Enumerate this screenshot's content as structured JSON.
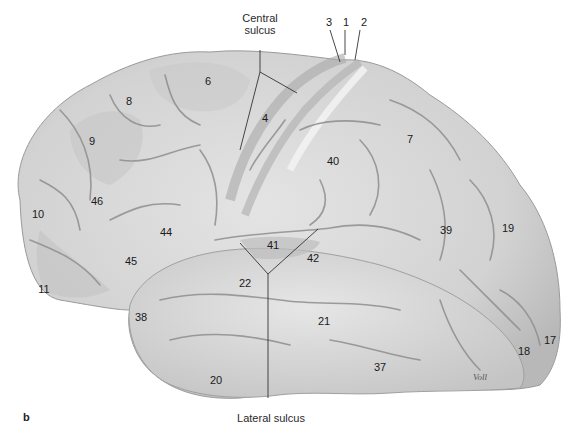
{
  "figure": {
    "panel_label": "b",
    "signature": "Voll",
    "leaders": {
      "central_sulcus": "Central\nsulcus",
      "central_sulcus_line1": "Central",
      "central_sulcus_line2": "sulcus",
      "lateral_sulcus": "Lateral sulcus",
      "top_numbers": [
        "3",
        "1",
        "2"
      ]
    },
    "brodmann_areas": [
      {
        "id": "6",
        "x": 208,
        "y": 81
      },
      {
        "id": "8",
        "x": 129,
        "y": 101
      },
      {
        "id": "4",
        "x": 265,
        "y": 118
      },
      {
        "id": "9",
        "x": 92,
        "y": 141
      },
      {
        "id": "7",
        "x": 410,
        "y": 139
      },
      {
        "id": "40",
        "x": 333,
        "y": 161
      },
      {
        "id": "46",
        "x": 97,
        "y": 201
      },
      {
        "id": "10",
        "x": 38,
        "y": 214
      },
      {
        "id": "44",
        "x": 166,
        "y": 232
      },
      {
        "id": "39",
        "x": 446,
        "y": 230
      },
      {
        "id": "19",
        "x": 508,
        "y": 228
      },
      {
        "id": "41",
        "x": 273,
        "y": 245
      },
      {
        "id": "42",
        "x": 313,
        "y": 258
      },
      {
        "id": "45",
        "x": 131,
        "y": 261
      },
      {
        "id": "22",
        "x": 245,
        "y": 283
      },
      {
        "id": "11",
        "x": 44,
        "y": 289
      },
      {
        "id": "38",
        "x": 141,
        "y": 317
      },
      {
        "id": "21",
        "x": 324,
        "y": 321
      },
      {
        "id": "17",
        "x": 550,
        "y": 340
      },
      {
        "id": "18",
        "x": 524,
        "y": 351
      },
      {
        "id": "37",
        "x": 380,
        "y": 367
      },
      {
        "id": "20",
        "x": 216,
        "y": 380
      }
    ]
  }
}
